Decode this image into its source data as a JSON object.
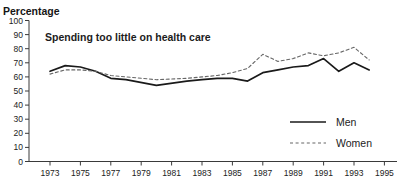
{
  "page": {
    "background": "#ffffff"
  },
  "header": {
    "top_title_partial": "1973-1994",
    "axis_unit_label": "Percentage"
  },
  "chart_data": {
    "type": "line",
    "annotation": "Spending too little on health care",
    "x": [
      1973,
      1974,
      1975,
      1976,
      1977,
      1978,
      1980,
      1982,
      1983,
      1984,
      1985,
      1986,
      1987,
      1988,
      1989,
      1990,
      1991,
      1992,
      1993,
      1994
    ],
    "series": [
      {
        "name": "Men",
        "style": "solid",
        "color": "#1a1a1a",
        "values": [
          64,
          68,
          67,
          64,
          59,
          58,
          54,
          57,
          58,
          59,
          59,
          57,
          63,
          65,
          67,
          68,
          73,
          64,
          70,
          65
        ]
      },
      {
        "name": "Women",
        "style": "dashed",
        "color": "#666666",
        "values": [
          62,
          65,
          65,
          64,
          61,
          60,
          58,
          59,
          60,
          61,
          63,
          66,
          76,
          71,
          73,
          77,
          75,
          77,
          81,
          72
        ]
      }
    ],
    "x_ticks": [
      1973,
      1975,
      1977,
      1979,
      1981,
      1983,
      1985,
      1987,
      1989,
      1991,
      1993,
      1995
    ],
    "y_ticks": [
      0,
      10,
      20,
      30,
      40,
      50,
      60,
      70,
      80,
      90,
      100
    ],
    "xlim": [
      1973,
      1995
    ],
    "ylim": [
      0,
      100
    ],
    "grid": false,
    "legend_position": "right-middle"
  }
}
